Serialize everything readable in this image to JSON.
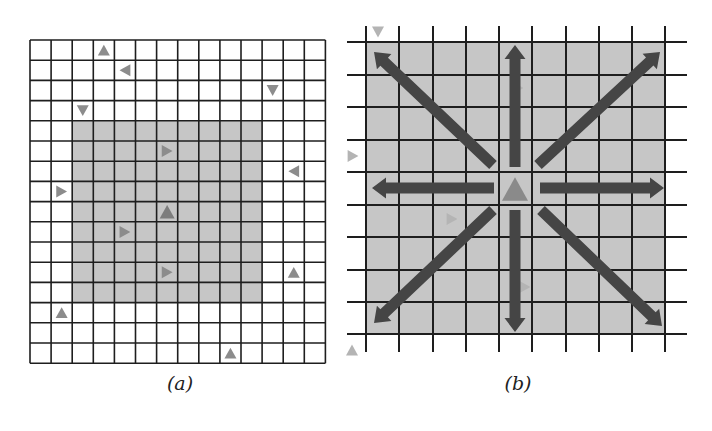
{
  "colors": {
    "grid_line": "#1e1e1e",
    "region_fill": "#c6c6c6",
    "background": "#ffffff",
    "agent": "#8c8c8c",
    "agent_faint": "#b4b4b4",
    "agent_center": "#8a8a8a",
    "arrow": "#454545"
  },
  "panels": [
    {
      "id": "a",
      "caption": "(a)",
      "caption_pos": [
        180,
        372
      ],
      "grid": {
        "x0": 30,
        "y0": 40,
        "cols": 14,
        "rows": 16,
        "cell_w": 21.1,
        "cell_h": 20.2,
        "style": "closed"
      },
      "region": {
        "col_start": 2,
        "col_end": 11,
        "row_start": 4,
        "row_end": 13
      },
      "agents": [
        {
          "col": 3,
          "row": 0,
          "dir": "up"
        },
        {
          "col": 4,
          "row": 1,
          "dir": "left"
        },
        {
          "col": 11,
          "row": 2,
          "dir": "down"
        },
        {
          "col": 2,
          "row": 3,
          "dir": "down"
        },
        {
          "col": 6,
          "row": 5,
          "dir": "right"
        },
        {
          "col": 12,
          "row": 6,
          "dir": "left"
        },
        {
          "col": 1,
          "row": 7,
          "dir": "right"
        },
        {
          "col": 6,
          "row": 8,
          "dir": "up",
          "emphasis": true
        },
        {
          "col": 4,
          "row": 9,
          "dir": "right"
        },
        {
          "col": 6,
          "row": 11,
          "dir": "right"
        },
        {
          "col": 12,
          "row": 11,
          "dir": "up"
        },
        {
          "col": 1,
          "row": 13,
          "dir": "up"
        },
        {
          "col": 9,
          "row": 15,
          "dir": "up"
        }
      ]
    },
    {
      "id": "b",
      "caption": "(b)",
      "caption_pos": [
        518,
        372
      ],
      "grid": {
        "v_lines": [
          366,
          399,
          433,
          466,
          499,
          532,
          566,
          599,
          632,
          665
        ],
        "h_lines": [
          42,
          75,
          107,
          140,
          172,
          205,
          237,
          270,
          302,
          334
        ],
        "v_extent": [
          26,
          352
        ],
        "h_extent": [
          347,
          687
        ],
        "style": "open"
      },
      "region": {
        "x": 366,
        "y": 42,
        "w": 299,
        "h": 292
      },
      "center_agent": {
        "x": 515,
        "y": 189,
        "dir": "up"
      },
      "faint_agents": [
        {
          "x": 378,
          "y": 32,
          "dir": "down"
        },
        {
          "x": 353,
          "y": 156,
          "dir": "right"
        },
        {
          "x": 452,
          "y": 219,
          "dir": "right"
        },
        {
          "x": 518,
          "y": 88,
          "dir": "right"
        },
        {
          "x": 525,
          "y": 287,
          "dir": "right"
        },
        {
          "x": 352,
          "y": 350,
          "dir": "up"
        }
      ],
      "arrows": [
        {
          "label": "north",
          "from": [
            515,
            167
          ],
          "to": [
            515,
            45
          ]
        },
        {
          "label": "south",
          "from": [
            515,
            210
          ],
          "to": [
            515,
            332
          ]
        },
        {
          "label": "west",
          "from": [
            494,
            188
          ],
          "to": [
            372,
            188
          ]
        },
        {
          "label": "east",
          "from": [
            540,
            188
          ],
          "to": [
            664,
            188
          ]
        },
        {
          "label": "north-west",
          "from": [
            493,
            165
          ],
          "to": [
            374,
            52
          ]
        },
        {
          "label": "north-east",
          "from": [
            538,
            165
          ],
          "to": [
            660,
            52
          ]
        },
        {
          "label": "south-west",
          "from": [
            493,
            210
          ],
          "to": [
            374,
            323
          ]
        },
        {
          "label": "south-east",
          "from": [
            541,
            210
          ],
          "to": [
            662,
            326
          ]
        }
      ]
    }
  ]
}
